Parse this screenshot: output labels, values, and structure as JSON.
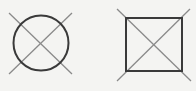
{
  "canvas": {
    "width": 196,
    "height": 91,
    "background": "#f4f4f2"
  },
  "colors": {
    "outline": "#3a3a3a",
    "cross": "#8a8a8a"
  },
  "symbols": [
    {
      "name": "crossed-circle",
      "shape": "circle",
      "cx": 41,
      "cy": 43,
      "r": 27.5,
      "cross_lines": [
        {
          "x1": 9,
          "y1": 13,
          "x2": 72,
          "y2": 74
        },
        {
          "x1": 72,
          "y1": 13,
          "x2": 9,
          "y2": 74
        }
      ]
    },
    {
      "name": "crossed-square",
      "shape": "square",
      "x": 126,
      "y": 18,
      "width": 56,
      "height": 53,
      "cross_lines": [
        {
          "x1": 117,
          "y1": 9,
          "x2": 191,
          "y2": 81
        },
        {
          "x1": 190,
          "y1": 9,
          "x2": 117,
          "y2": 81
        }
      ]
    }
  ]
}
